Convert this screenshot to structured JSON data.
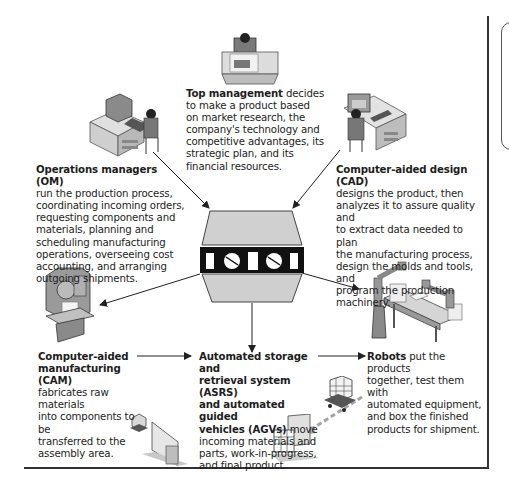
{
  "diagram": {
    "center": {
      "label": "Manufacturing control computer",
      "icon": "central-computer-icon"
    },
    "nodes": [
      {
        "id": "top-management",
        "title": "Top management",
        "body": " decides to make a product based on market research, the company's technology and competitive advantages, its strategic plan, and its financial resources.",
        "lines": [
          "decides",
          "to make a product based",
          "on market research, the",
          "company's technology and",
          "competitive advantages, its",
          "strategic plan, and its",
          "financial resources."
        ],
        "icon": "executive-desk-icon"
      },
      {
        "id": "operations-managers",
        "title": "Operations managers (OM)",
        "lines": [
          "run the production process,",
          "coordinating incoming orders,",
          "requesting components and",
          "materials, planning and",
          "scheduling manufacturing",
          "operations, overseeing cost",
          "accounting, and arranging",
          "outgoing shipments."
        ],
        "icon": "computer-workstation-icon"
      },
      {
        "id": "cad",
        "title": "Computer-aided design (CAD)",
        "lines": [
          "designs the product, then",
          "analyzes it to assure quality and",
          "to extract data needed to plan",
          "the manufacturing process,",
          "design the molds and tools, and",
          "program the production",
          "machinery."
        ],
        "icon": "design-workstation-icon"
      },
      {
        "id": "cam",
        "title_lines": [
          "Computer-aided",
          "manufacturing (CAM)"
        ],
        "lines": [
          "fabricates raw materials",
          "into components to be",
          "transferred to the",
          "assembly area."
        ],
        "icon": "milling-machine-icon"
      },
      {
        "id": "asrs",
        "title_lines": [
          "Automated storage and",
          "retrieval system (ASRS)",
          "and automated guided",
          "vehicles (AGVs)"
        ],
        "title_tail": " move",
        "lines": [
          "incoming materials and",
          "parts, work-in-progress,",
          "and final product."
        ],
        "icon": "storage-rack-icon"
      },
      {
        "id": "robots",
        "title": "Robots",
        "first_line_tail": " put the products",
        "lines": [
          "together, test them with",
          "automated equipment,",
          "and box the finished",
          "products for shipment."
        ],
        "icon": "robot-arm-icon"
      }
    ],
    "arrows": [
      {
        "from": "operations-managers",
        "to": "center"
      },
      {
        "from": "cad",
        "to": "center"
      },
      {
        "from": "center",
        "to": "cam"
      },
      {
        "from": "center",
        "to": "asrs"
      },
      {
        "from": "center",
        "to": "robots"
      },
      {
        "from": "cam",
        "to": "asrs"
      },
      {
        "from": "asrs",
        "to": "robots"
      }
    ],
    "colors": {
      "line": "#222222",
      "illustration_fill": "#c8c8c8",
      "illustration_dark": "#7a7a7a",
      "panel_black": "#111111"
    }
  }
}
